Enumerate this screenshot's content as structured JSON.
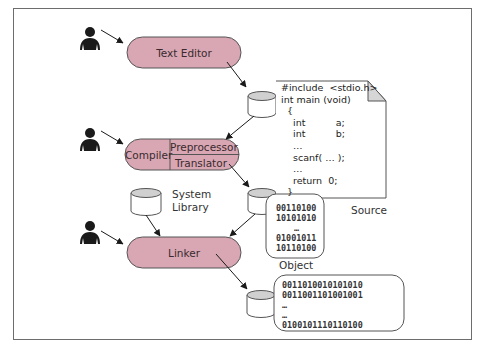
{
  "diagram": {
    "colors": {
      "process_fill": "#d8a7b3",
      "process_stroke": "#555555",
      "storage_fill": "#ffffff",
      "storage_top": "#d0d0d0",
      "frame_stroke": "#6d6d6d",
      "user_icon": "#1a1a1a"
    },
    "users": [
      {
        "name": "user-editor",
        "icon": "person-icon"
      },
      {
        "name": "user-compiler",
        "icon": "person-icon"
      },
      {
        "name": "user-linker",
        "icon": "person-icon"
      }
    ],
    "processes": {
      "text_editor": {
        "label": "Text Editor"
      },
      "compiler": {
        "label": "Compiler",
        "stages": [
          "Preprocessor",
          "Translator"
        ]
      },
      "linker": {
        "label": "Linker"
      }
    },
    "storage": {
      "system_library": {
        "label_line1": "System",
        "label_line2": "Library"
      }
    },
    "source_file": {
      "caption": "Source",
      "lines": [
        "#include  <stdio.h>",
        "int main (void)",
        "  {",
        "    int          a;",
        "    int          b;",
        "    …",
        "    scanf( … );",
        "    …",
        "    return  0;",
        "  }"
      ]
    },
    "object_file": {
      "caption": "Object",
      "lines": [
        "00110100",
        "10101010",
        "…",
        "01001011",
        "10110100"
      ]
    },
    "executable_file": {
      "lines": [
        "0011010010101010",
        "0011001101001001",
        "…",
        "…",
        "0100101110110100"
      ]
    }
  }
}
